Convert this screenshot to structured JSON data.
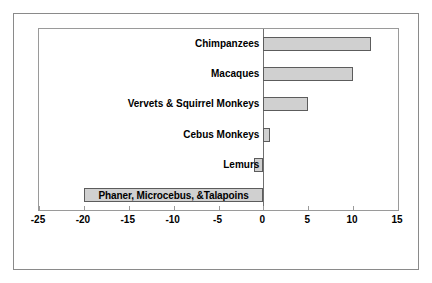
{
  "chart_data": {
    "type": "bar",
    "orientation": "horizontal",
    "title": "",
    "xlabel": "",
    "ylabel": "",
    "xlim": [
      -25,
      15
    ],
    "xticks": [
      -25,
      -20,
      -15,
      -10,
      -5,
      0,
      5,
      10,
      15
    ],
    "xtick_labels": [
      "-25",
      "-20",
      "-15",
      "-10",
      "-5",
      "0",
      "5",
      "10",
      "15"
    ],
    "grid": false,
    "legend": false,
    "bar_color": "#d0d0d0",
    "bar_edge_color": "#5c5c5c",
    "categories": [
      "Chimpanzees",
      "Macaques",
      "Vervets & Squirrel Monkeys",
      "Cebus Monkeys",
      "Lemurs",
      "Phaner, Microcebus, &Talapoins"
    ],
    "values": [
      12,
      10,
      5,
      0.7,
      -1,
      -20
    ],
    "label_placement": [
      "outside",
      "outside",
      "outside",
      "outside",
      "outside",
      "inside"
    ]
  }
}
